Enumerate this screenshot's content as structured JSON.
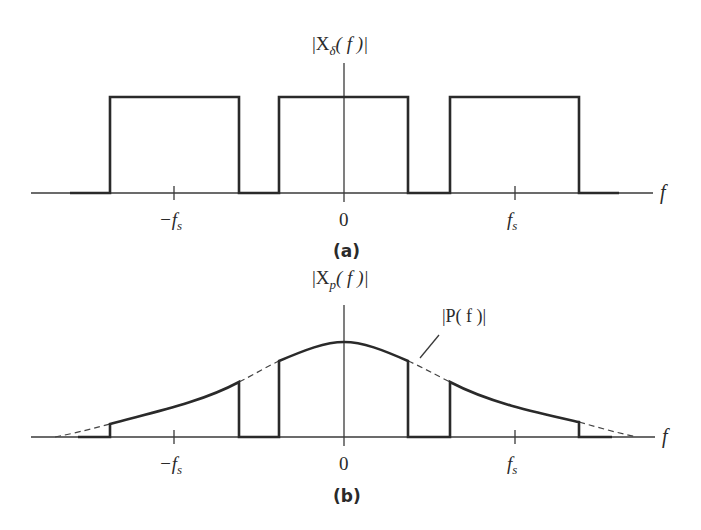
{
  "figure_a": {
    "y_label_main": "|X",
    "y_label_sub": "δ",
    "y_label_tail": "( f )|",
    "x_label": "f",
    "ticks": {
      "neg": "−f",
      "neg_sub": "s",
      "zero": "0",
      "pos": "f",
      "pos_sub": "s"
    },
    "caption": "(a)",
    "description": "Three rectangular pulses of equal height centered at −fs, 0, fs"
  },
  "figure_b": {
    "y_label_main": "|X",
    "y_label_sub": "p",
    "y_label_tail": "( f )|",
    "x_label": "f",
    "curve_label": "|P( f )|",
    "ticks": {
      "neg": "−f",
      "neg_sub": "s",
      "zero": "0",
      "pos": "f",
      "pos_sub": "s"
    },
    "caption": "(b)",
    "description": "Pulses shaped by envelope |P(f)| (dashed bell curve) centered at −fs, 0, fs"
  }
}
